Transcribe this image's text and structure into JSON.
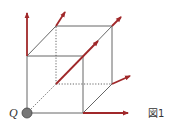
{
  "figure": {
    "caption": "図1",
    "point_label": "Q",
    "colors": {
      "edge": "#555555",
      "arrow": "#a0282a",
      "point_fill": "#777777"
    },
    "cube": {
      "front_bottom_left": [
        27,
        113
      ],
      "front_bottom_right": [
        83,
        113
      ],
      "front_top_left": [
        27,
        56
      ],
      "front_top_right": [
        83,
        56
      ],
      "back_bottom_left": [
        56,
        84
      ],
      "back_bottom_right": [
        112,
        84
      ],
      "back_top_left": [
        56,
        26
      ],
      "back_top_right": [
        112,
        26
      ]
    },
    "arrows": [
      {
        "name": "arrow-up-from-front-top-left",
        "from": [
          27,
          56
        ],
        "to": [
          27,
          13
        ]
      },
      {
        "name": "arrow-from-back-top-left",
        "from": [
          56,
          26
        ],
        "to": [
          65,
          12
        ]
      },
      {
        "name": "arrow-from-back-top-right",
        "from": [
          112,
          26
        ],
        "to": [
          121,
          17
        ]
      },
      {
        "name": "arrow-diagonal-through-cube",
        "from": [
          56,
          84
        ],
        "to": [
          98,
          41
        ]
      },
      {
        "name": "arrow-from-back-bottom-right",
        "from": [
          112,
          84
        ],
        "to": [
          130,
          76
        ]
      },
      {
        "name": "arrow-right-from-front-bottom-right",
        "from": [
          83,
          113
        ],
        "to": [
          128,
          113
        ]
      }
    ]
  }
}
